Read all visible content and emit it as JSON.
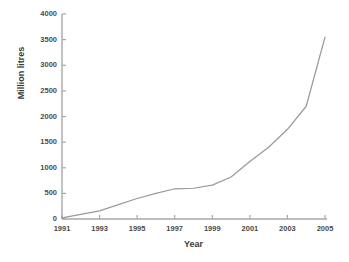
{
  "chart_data": {
    "type": "line",
    "title": "",
    "xlabel": "Year",
    "ylabel": "Million litres",
    "xlim": [
      1991,
      2005
    ],
    "ylim": [
      0,
      4000
    ],
    "grid": false,
    "legend": null,
    "xticks": [
      "1991",
      "1993",
      "1995",
      "1997",
      "1999",
      "2001",
      "2003",
      "2005"
    ],
    "yticks": [
      "0",
      "500",
      "1000",
      "1500",
      "2000",
      "2500",
      "3000",
      "3500",
      "4000"
    ],
    "line_color": "#9a9a9a",
    "axis_color": "#a8a8a8",
    "x": [
      1991,
      1992,
      1993,
      1994,
      1995,
      1996,
      1997,
      1998,
      1999,
      2000,
      2001,
      2002,
      2003,
      2004,
      2005
    ],
    "values": [
      20,
      90,
      160,
      280,
      400,
      500,
      590,
      600,
      660,
      820,
      1120,
      1400,
      1750,
      2200,
      3550
    ],
    "series": [
      {
        "name": "Million litres",
        "values": [
          20,
          90,
          160,
          280,
          400,
          500,
          590,
          600,
          660,
          820,
          1120,
          1400,
          1750,
          2200,
          3550
        ]
      }
    ]
  },
  "axis": {
    "ylabel_text": "Million litres",
    "xlabel_text": "Year"
  }
}
